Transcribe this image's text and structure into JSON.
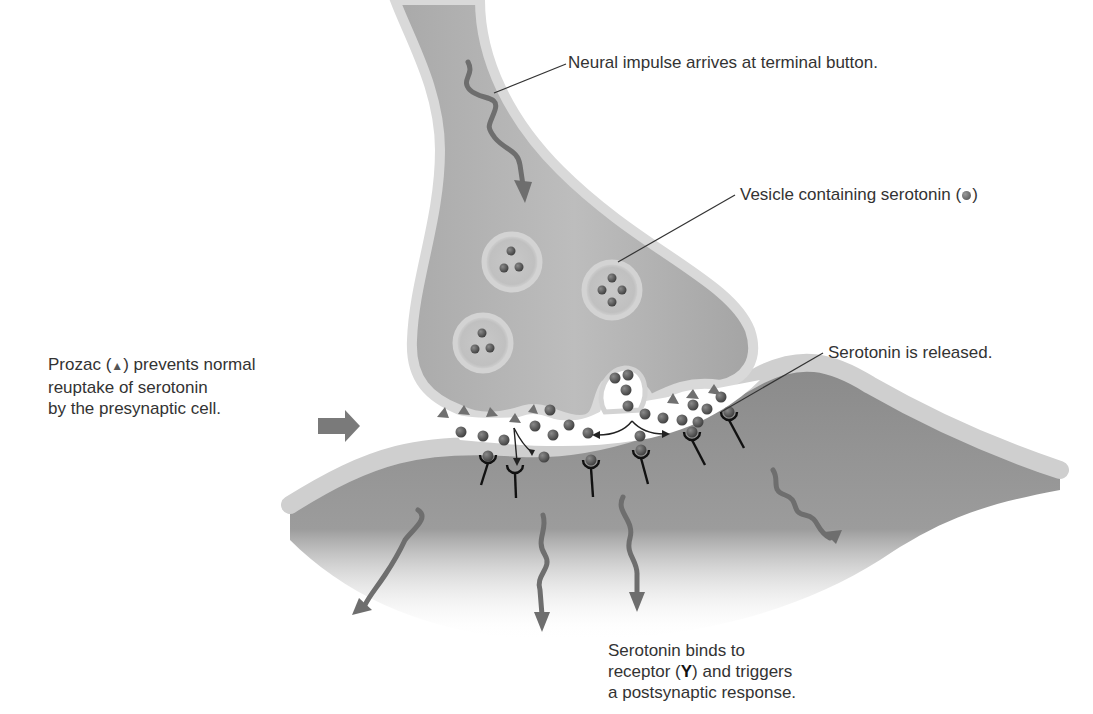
{
  "diagram": {
    "colors": {
      "presynaptic_fill": "#b4b4b4",
      "membrane": "#d6d6d6",
      "postsynaptic_fill": "#8c8c8c",
      "serotonin": "#555555",
      "prozac": "#707070",
      "arrow": "#6e6e6e",
      "text": "#333333"
    },
    "labels": {
      "impulse": "Neural impulse arrives at terminal button.",
      "vesicle_prefix": "Vesicle containing serotonin (",
      "vesicle_suffix": ")",
      "released": "Serotonin is released.",
      "prozac_line1_prefix": "Prozac (",
      "prozac_symbol": "▲",
      "prozac_line1_suffix": ") prevents normal",
      "prozac_line2": "reuptake of serotonin",
      "prozac_line3": "by the presynaptic cell.",
      "binds_line1": "Serotonin binds to",
      "binds_line2_prefix": "receptor (",
      "receptor_symbol": "Y",
      "binds_line2_suffix": ") and triggers",
      "binds_line3": "a postsynaptic response."
    },
    "legend_symbols": {
      "serotonin": "serotonin-molecule-dot",
      "prozac": "prozac-triangle",
      "receptor": "receptor-y-shape"
    }
  }
}
